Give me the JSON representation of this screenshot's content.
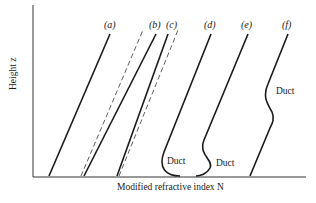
{
  "figure": {
    "axes": {
      "xlabel": "Modified refractive index N",
      "ylabel": "Height z"
    },
    "curves": [
      {
        "id": "a",
        "label": "(a)",
        "style": "solid"
      },
      {
        "id": "b",
        "label": "(b)",
        "style": "solid + dashed reference"
      },
      {
        "id": "c",
        "label": "(c)",
        "style": "solid + dashed reference"
      },
      {
        "id": "d",
        "label": "(d)",
        "style": "solid",
        "annotation": "Duct"
      },
      {
        "id": "e",
        "label": "(e)",
        "style": "solid",
        "annotation": "Duct"
      },
      {
        "id": "f",
        "label": "(f)",
        "style": "solid",
        "annotation": "Duct"
      }
    ],
    "annotations": [
      "Duct",
      "Duct",
      "Duct"
    ],
    "colors": {
      "line": "#1a1a1a",
      "background": "#ffffff"
    }
  }
}
